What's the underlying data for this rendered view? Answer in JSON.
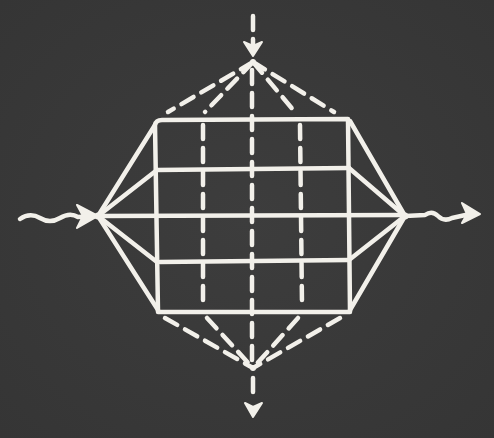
{
  "diagram": {
    "description": "Chalk drawing on blackboard: a rectangular grid inside a diamond (octahedral) frame, with wavy horizontal input/output arrows and dashed vertical in/out arrows",
    "colors": {
      "background": "#3a3a3a",
      "chalk": "#f2f0ea"
    },
    "nodes": {
      "top_apex": [
        253,
        62
      ],
      "bottom_apex": [
        253,
        368
      ],
      "left_vertex": [
        98,
        216
      ],
      "right_vertex": [
        405,
        216
      ]
    },
    "grid": {
      "x_left": 157,
      "x_right": 350,
      "y_top": 120,
      "y_bottom": 312,
      "horizontal_lines_y": [
        170,
        216,
        262
      ],
      "dashed_vertical_lines_x": [
        203,
        252,
        300
      ]
    },
    "arrows": [
      {
        "name": "input-wave",
        "direction": "right",
        "style": "wavy-solid"
      },
      {
        "name": "output-wave",
        "direction": "right",
        "style": "wavy-solid"
      },
      {
        "name": "top-inflow",
        "direction": "down",
        "style": "dashed"
      },
      {
        "name": "bottom-outflow",
        "direction": "down",
        "style": "dashed"
      }
    ],
    "labels": []
  }
}
